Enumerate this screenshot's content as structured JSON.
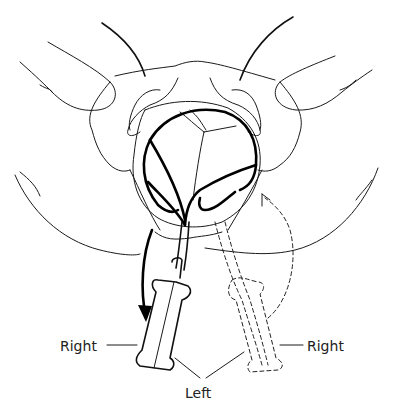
{
  "figure": {
    "type": "medical-illustration",
    "labels": {
      "handle_left_right": "Right",
      "handle_right_right": "Right",
      "bottom_left": "Left"
    },
    "line_color": "#1a1a1a",
    "background_color": "#ffffff"
  }
}
